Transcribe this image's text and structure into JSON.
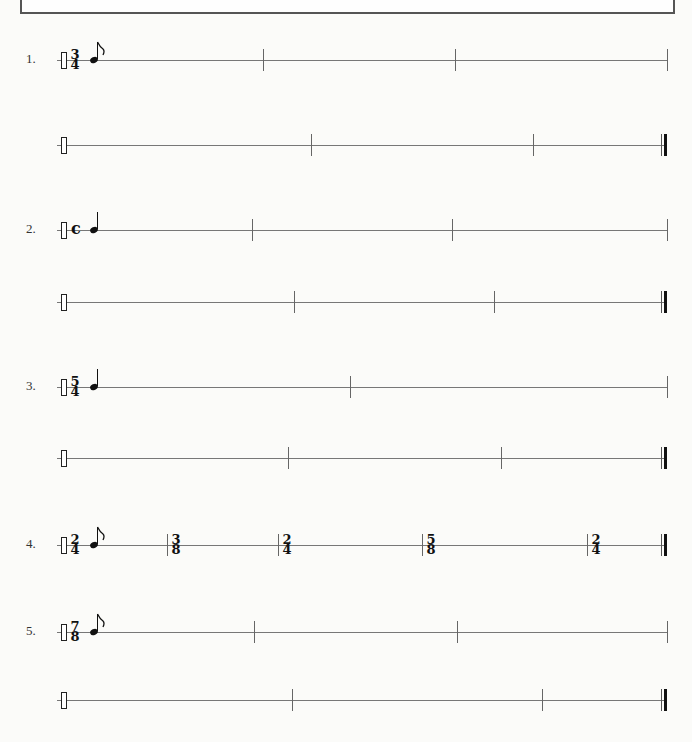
{
  "header_box": {
    "visible": true
  },
  "exercises": [
    {
      "number": "1.",
      "time_signature": {
        "top": "3",
        "bottom": "4"
      },
      "note": "eighth",
      "lines": [
        {
          "barlines": [
            263,
            455,
            667
          ],
          "final": false
        },
        {
          "barlines": [
            311,
            533
          ],
          "final": true
        }
      ]
    },
    {
      "number": "2.",
      "time_signature": {
        "symbol": "c"
      },
      "note": "quarter",
      "lines": [
        {
          "barlines": [
            252,
            452,
            667
          ],
          "final": false
        },
        {
          "barlines": [
            294,
            494
          ],
          "final": true
        }
      ]
    },
    {
      "number": "3.",
      "time_signature": {
        "top": "5",
        "bottom": "4"
      },
      "note": "quarter",
      "lines": [
        {
          "barlines": [
            350,
            667
          ],
          "final": false
        },
        {
          "barlines": [
            288,
            501
          ],
          "final": true
        }
      ]
    },
    {
      "number": "4.",
      "time_signature": {
        "top": "2",
        "bottom": "4"
      },
      "note": "eighth",
      "meter_changes": [
        {
          "x": 167,
          "top": "3",
          "bottom": "8"
        },
        {
          "x": 278,
          "top": "2",
          "bottom": "4"
        },
        {
          "x": 422,
          "top": "5",
          "bottom": "8"
        },
        {
          "x": 587,
          "top": "2",
          "bottom": "4"
        }
      ],
      "lines": [
        {
          "barlines": [],
          "final": true
        }
      ]
    },
    {
      "number": "5.",
      "time_signature": {
        "top": "7",
        "bottom": "8"
      },
      "note": "eighth",
      "lines": [
        {
          "barlines": [
            254,
            457,
            667
          ],
          "final": false
        },
        {
          "barlines": [
            292,
            542
          ],
          "final": true
        }
      ]
    }
  ]
}
